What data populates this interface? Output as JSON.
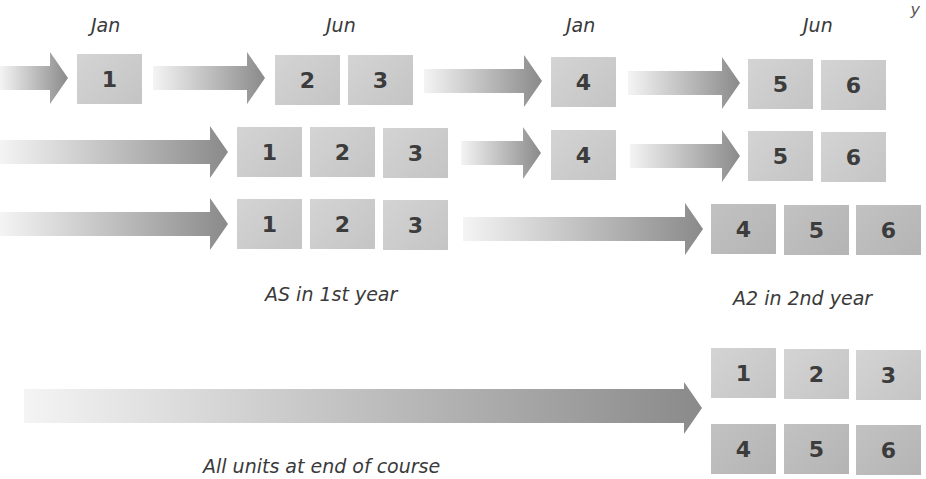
{
  "diagram": {
    "type": "exam-unit-scheduling-timeline",
    "month_labels": [
      "Jan",
      "Jun",
      "Jan",
      "Jun"
    ],
    "rows": [
      {
        "name": "staged-modular",
        "groups": [
          {
            "units": [
              "1"
            ],
            "period": "Jan (year 1)"
          },
          {
            "units": [
              "2",
              "3"
            ],
            "period": "Jun (year 1)"
          },
          {
            "units": [
              "4"
            ],
            "period": "Jan (year 2)"
          },
          {
            "units": [
              "5",
              "6"
            ],
            "period": "Jun (year 2)"
          }
        ]
      },
      {
        "name": "as-end-year1-then-staged",
        "groups": [
          {
            "units": [
              "1",
              "2",
              "3"
            ],
            "period": "Jun (year 1)"
          },
          {
            "units": [
              "4"
            ],
            "period": "Jan (year 2)"
          },
          {
            "units": [
              "5",
              "6"
            ],
            "period": "Jun (year 2)"
          }
        ]
      },
      {
        "name": "as-then-a2",
        "groups": [
          {
            "units": [
              "1",
              "2",
              "3"
            ],
            "period": "Jun (year 1)"
          },
          {
            "units": [
              "4",
              "5",
              "6"
            ],
            "period": "Jun (year 2)"
          }
        ]
      },
      {
        "name": "linear",
        "groups": [
          {
            "units": [
              "1",
              "2",
              "3",
              "4",
              "5",
              "6"
            ],
            "period": "End of course"
          }
        ]
      }
    ],
    "captions": {
      "as": "AS in 1st year",
      "a2": "A2 in 2nd year",
      "linear": "All units at end of course"
    },
    "corner_glyph": "y"
  },
  "colors": {
    "box_light": "#d0d0d0",
    "box_dark": "#bdbdbd",
    "arrow_start": "#f2f2f2",
    "arrow_end": "#8c8c8c",
    "text": "#3a3a3a"
  }
}
